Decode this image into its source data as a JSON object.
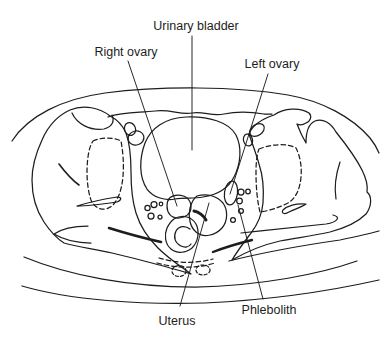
{
  "figure": {
    "background_color": "#ffffff",
    "line_color": "#1d1d1d",
    "labels": {
      "urinary_bladder": "Urinary bladder",
      "right_ovary": "Right ovary",
      "left_ovary": "Left ovary",
      "uterus": "Uterus",
      "phlebolith": "Phlebolith"
    }
  }
}
